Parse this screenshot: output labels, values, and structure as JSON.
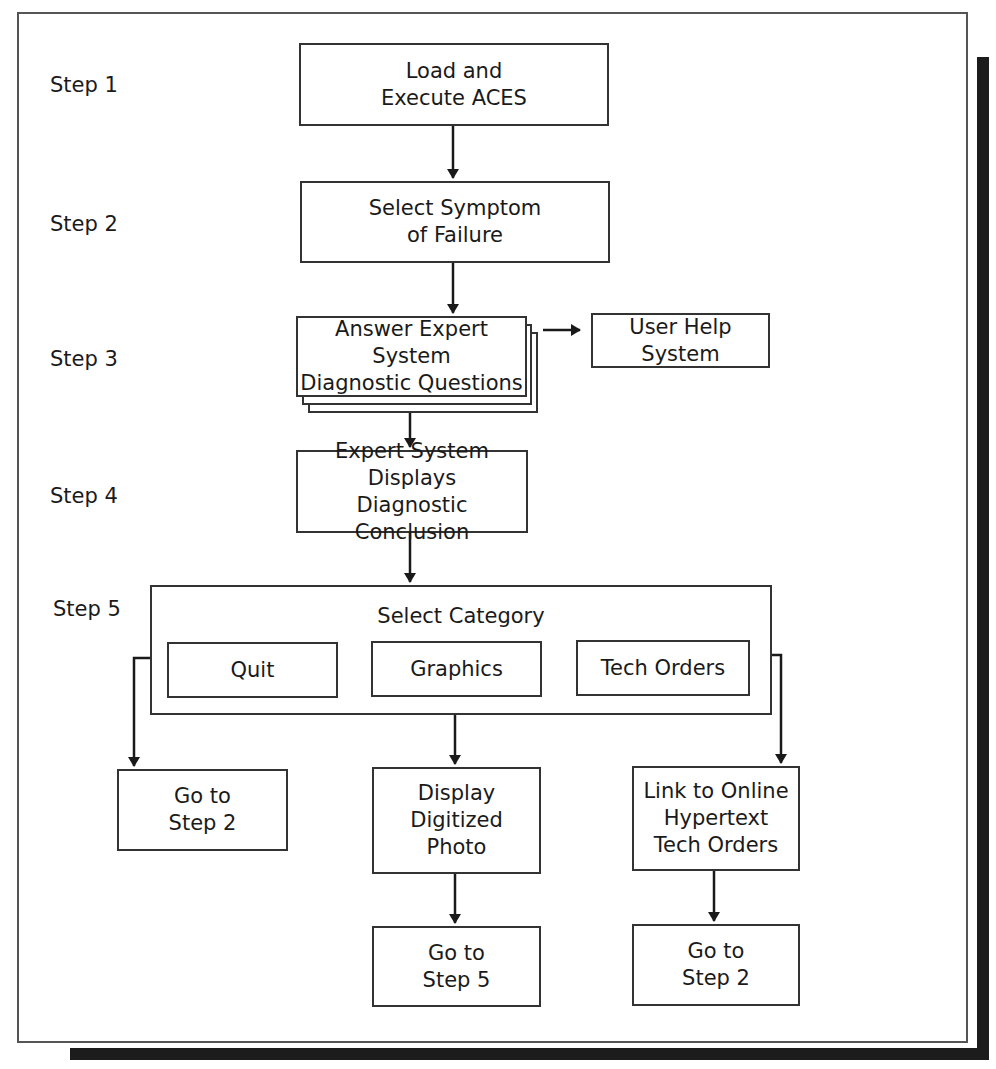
{
  "diagram": {
    "type": "flowchart",
    "steps": [
      {
        "label": "Step 1"
      },
      {
        "label": "Step 2"
      },
      {
        "label": "Step 3"
      },
      {
        "label": "Step 4"
      },
      {
        "label": "Step 5"
      }
    ],
    "nodes": {
      "load_execute": "Load and\nExecute ACES",
      "select_symptom": "Select Symptom\nof Failure",
      "answer_questions": "Answer Expert System\nDiagnostic Questions",
      "user_help": "User Help System",
      "displays_conclusion": "Expert System Displays\nDiagnostic Conclusion",
      "select_category": "Select Category",
      "quit": "Quit",
      "graphics": "Graphics",
      "tech_orders": "Tech Orders",
      "goto_step2_left": "Go to\nStep 2",
      "display_photo": "Display\nDigitized\nPhoto",
      "link_hypertext": "Link to Online\nHypertext\nTech Orders",
      "goto_step5": "Go to\nStep 5",
      "goto_step2_right": "Go to\nStep 2"
    },
    "edges": [
      [
        "load_execute",
        "select_symptom"
      ],
      [
        "select_symptom",
        "answer_questions"
      ],
      [
        "answer_questions",
        "user_help"
      ],
      [
        "answer_questions",
        "displays_conclusion"
      ],
      [
        "displays_conclusion",
        "select_category"
      ],
      [
        "quit",
        "goto_step2_left"
      ],
      [
        "graphics",
        "display_photo"
      ],
      [
        "tech_orders",
        "link_hypertext"
      ],
      [
        "display_photo",
        "goto_step5"
      ],
      [
        "link_hypertext",
        "goto_step2_right"
      ]
    ],
    "colors": {
      "line": "#1a1a1a",
      "shadow": "#1c1c1c",
      "background": "#ffffff"
    }
  }
}
